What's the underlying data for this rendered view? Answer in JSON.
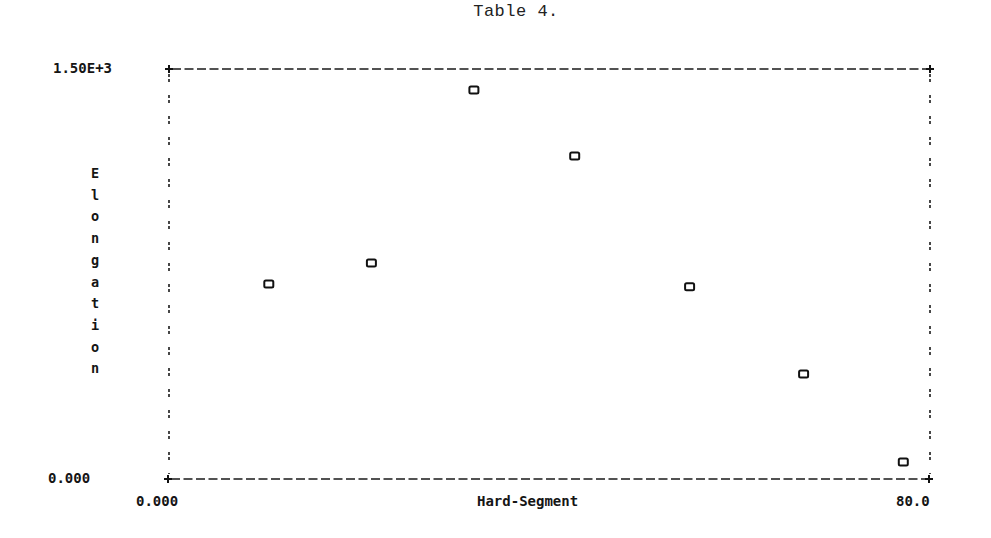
{
  "chart": {
    "title": "Table 4.",
    "ytick_top": "1.50E+3",
    "ytick_bottom": "0.000",
    "xtick_left": "0.000",
    "xtick_right": "80.0",
    "xlabel": "Hard-Segment",
    "ylabel": "Elongation",
    "marker": "o"
  },
  "chart_data": {
    "type": "scatter",
    "title": "Table 4.",
    "xlabel": "Hard-Segment",
    "ylabel": "Elongation",
    "xlim": [
      0,
      80
    ],
    "ylim": [
      0,
      1500
    ],
    "xtick_labels": [
      "0.000",
      "80.0"
    ],
    "ytick_labels": [
      "0.000",
      "1.50E+3"
    ],
    "grid": false,
    "legend": null,
    "marker": "open square 'o'",
    "frame": "dashed box",
    "series": [
      {
        "name": "Elongation",
        "x": [
          10.5,
          21.3,
          32.1,
          42.7,
          54.8,
          66.8,
          77.3
        ],
        "y": [
          713,
          790,
          1423,
          1182,
          703,
          384,
          62
        ]
      }
    ]
  }
}
